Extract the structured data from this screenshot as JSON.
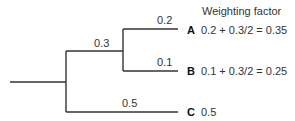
{
  "diagram": {
    "header": "Weighting factor",
    "branches": {
      "internal": "0.3",
      "a": "0.2",
      "b": "0.1",
      "c": "0.5"
    },
    "leaves": [
      {
        "name": "A",
        "formula": "0.2 + 0.3/2 = 0.35"
      },
      {
        "name": "B",
        "formula": "0.1 + 0.3/2 = 0.25"
      },
      {
        "name": "C",
        "formula": "0.5"
      }
    ]
  }
}
